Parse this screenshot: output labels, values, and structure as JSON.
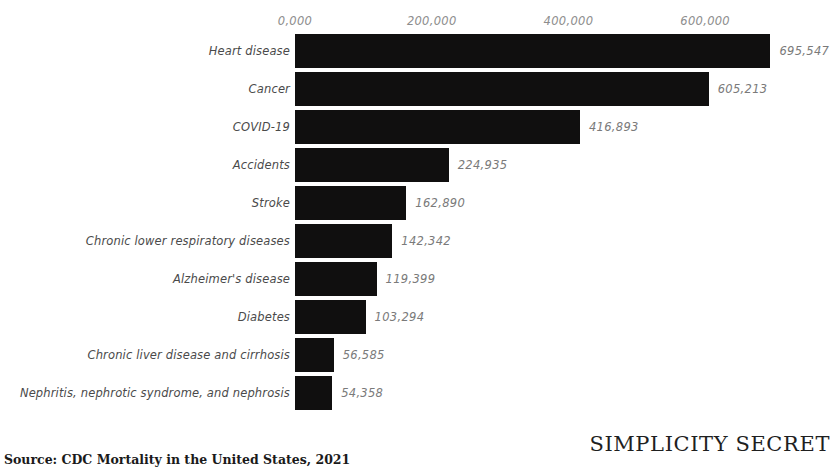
{
  "chart_data": {
    "type": "bar",
    "orientation": "horizontal",
    "title": "",
    "xlabel": "",
    "ylabel": "",
    "grid": false,
    "legend": null,
    "xlim": [
      0,
      700000
    ],
    "xticks": [
      "0,000",
      "200,000",
      "400,000",
      "600,000"
    ],
    "xtick_values": [
      0,
      200000,
      400000,
      600000
    ],
    "categories": [
      "Heart disease",
      "Cancer",
      "COVID-19",
      "Accidents",
      "Stroke",
      "Chronic lower respiratory diseases",
      "Alzheimer's disease",
      "Diabetes",
      "Chronic liver disease and cirrhosis",
      "Nephritis, nephrotic syndrome, and nephrosis"
    ],
    "values": [
      695547,
      605213,
      416893,
      224935,
      162890,
      142342,
      119399,
      103294,
      56585,
      54358
    ],
    "value_labels": [
      "695,547",
      "605,213",
      "416,893",
      "224,935",
      "162,890",
      "142,342",
      "119,399",
      "103,294",
      "56,585",
      "54,358"
    ],
    "bar_color": "#100f0f"
  },
  "footer": {
    "source": "Source: CDC Mortality in the United States, 2021",
    "brand": "SIMPLICITY SECRET"
  },
  "colors": {
    "background": "#ffffff",
    "bar": "#100f0f",
    "category_text": "#4a4a4a",
    "value_text": "#7a7a7a",
    "tick_text": "#8d8d8d",
    "footer_text": "#1a1a1a"
  }
}
